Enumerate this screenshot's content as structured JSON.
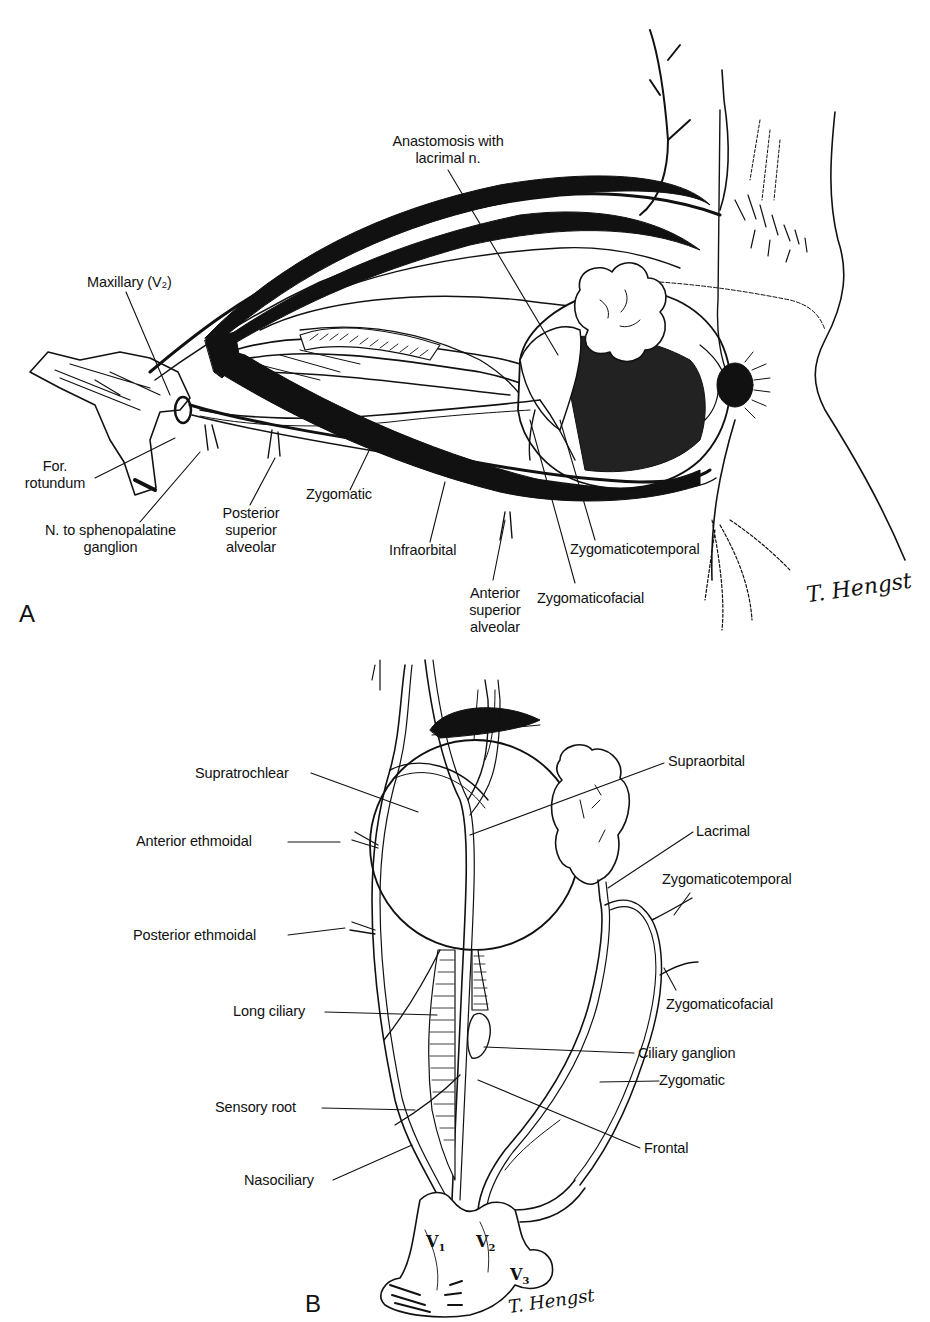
{
  "figure": {
    "panel_a": {
      "letter": "A",
      "labels": {
        "anastomosis": "Anastomosis with\nlacrimal n.",
        "anastomosis_line1": "Anastomosis with",
        "anastomosis_line2": "lacrimal n.",
        "maxillary": "Maxillary (V₂)",
        "for_rotundum_line1": "For.",
        "for_rotundum_line2": "rotundum",
        "n_sphenopalatine_line1": "N. to sphenopalatine",
        "n_sphenopalatine_line2": "ganglion",
        "posterior_sup_alv_line1": "Posterior",
        "posterior_sup_alv_line2": "superior",
        "posterior_sup_alv_line3": "alveolar",
        "zygomatic": "Zygomatic",
        "infraorbital": "Infraorbital",
        "anterior_sup_alv_line1": "Anterior",
        "anterior_sup_alv_line2": "superior",
        "anterior_sup_alv_line3": "alveolar",
        "zygomaticotemporal": "Zygomaticotemporal",
        "zygomaticofacial": "Zygomaticofacial"
      },
      "signature": "T. Hengst"
    },
    "panel_b": {
      "letter": "B",
      "labels": {
        "supratrochlear": "Supratrochlear",
        "supraorbital": "Supraorbital",
        "anterior_ethmoidal": "Anterior ethmoidal",
        "lacrimal": "Lacrimal",
        "zygomaticotemporal": "Zygomaticotemporal",
        "posterior_ethmoidal": "Posterior ethmoidal",
        "zygomaticofacial": "Zygomaticofacial",
        "long_ciliary": "Long ciliary",
        "ciliary_ganglion": "Ciliary ganglion",
        "zygomatic": "Zygomatic",
        "sensory_root": "Sensory root",
        "frontal": "Frontal",
        "nasociliary": "Nasociliary"
      },
      "trigeminal_divisions": {
        "v1": "V",
        "v1_sub": "1",
        "v2": "V",
        "v2_sub": "2",
        "v3": "V",
        "v3_sub": "3"
      },
      "signature": "T. Hengst"
    }
  },
  "colors": {
    "ink": "#111111",
    "background": "#ffffff"
  }
}
